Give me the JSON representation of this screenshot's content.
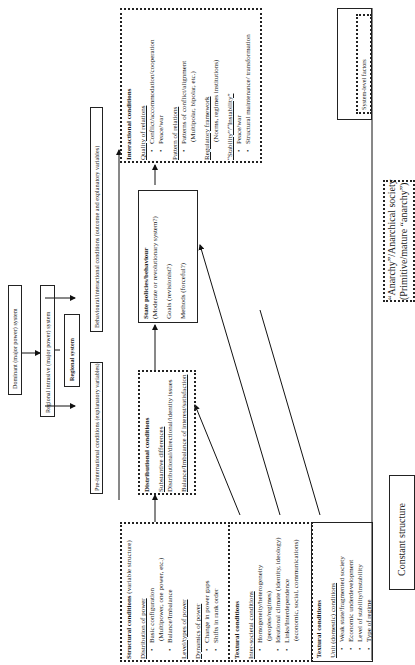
{
  "system_boxes": {
    "dominant": "Dominant (major power) system",
    "regional_intrusive": "Regional intrusive (major power) system",
    "regional": "Regional system"
  },
  "level_headers": {
    "pre_international": "Pre-international conditions (explanatory variables)",
    "behavioural": "Behavioural/interactional conditions (outcome and explanatory variables)"
  },
  "structural": {
    "title": "Structural conditions",
    "subtitle": "(variable structure)",
    "sections": [
      {
        "heading": "Distribution of power",
        "items": [
          "Basic configuration",
          "(Multipower, one power, etc.)",
          "Balance/Imbalance"
        ]
      },
      {
        "heading": "Level/types of power",
        "items": []
      },
      {
        "heading": "Dynamics of power",
        "items": [
          "Change in power gaps",
          "Shifts in rank order"
        ]
      }
    ]
  },
  "textural_intersocietal": {
    "title": "Textural conditions",
    "heading": "Inter-societal conditions",
    "items": [
      "Homogeneity/heterogeneity",
      "(peoples/regimes)",
      "Ideational climate (identity, ideology)",
      "Links/Interdependence",
      "(economic, social, communications)"
    ]
  },
  "textural_unit": {
    "title": "Textural conditions",
    "heading": "Unit (domestic) conditions",
    "items": [
      "Weak state/fragmented society",
      "Economic underdevelopment",
      "Level of stability/instability",
      "Type of regime"
    ]
  },
  "distributional": {
    "title": "Distributional conditions",
    "heading": "Substantive differences",
    "items": [
      "Distributional/directional/identity issues",
      "Balance/Imbalance of interest/satisfaction"
    ]
  },
  "state_policies": {
    "title": "State policies/behaviour",
    "items": [
      "(Moderate or revolutionary system?)",
      "Goals (revisionist?)",
      "Methods (forceful?)"
    ]
  },
  "interactional": {
    "title": "Interactional conditions",
    "sections": [
      {
        "heading": "Quality of relations",
        "items": [
          "Conflict/accommodation/cooperation",
          "Peace/war"
        ]
      },
      {
        "heading": "Pattern of relations",
        "items": [
          "Patterns of conflict/alignment",
          "(Multipolar, bipolar, etc.)"
        ]
      },
      {
        "heading": "Regulatory framework",
        "items": [
          "(Norms, regimes institutions)"
        ]
      },
      {
        "heading": "“Stability”/“Instability”",
        "items": [
          "Peace/war",
          "Structural maintenance/ transformation"
        ]
      }
    ]
  },
  "constant_structure": {
    "label": "Constant structure",
    "anarchy_line1": "“Anarchy”/Anarchical society",
    "anarchy_line2": "(Primitive/mature “anarchy”)",
    "system_level": "System-level factors"
  }
}
